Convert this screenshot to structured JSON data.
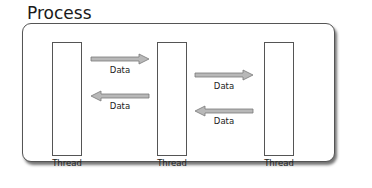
{
  "diagram": {
    "title": "Process",
    "threads": [
      {
        "label": "Thread"
      },
      {
        "label": "Thread"
      },
      {
        "label": "Thread"
      }
    ],
    "arrows": [
      {
        "direction": "right",
        "from": "thread-1",
        "to": "thread-2",
        "label": "Data"
      },
      {
        "direction": "left",
        "from": "thread-2",
        "to": "thread-1",
        "label": "Data"
      },
      {
        "direction": "right",
        "from": "thread-2",
        "to": "thread-3",
        "label": "Data"
      },
      {
        "direction": "left",
        "from": "thread-3",
        "to": "thread-2",
        "label": "Data"
      }
    ],
    "colors": {
      "border": "#555555",
      "arrow_fill": "#b8b8b8",
      "arrow_stroke": "#7a7a7a",
      "background": "#ffffff"
    }
  }
}
